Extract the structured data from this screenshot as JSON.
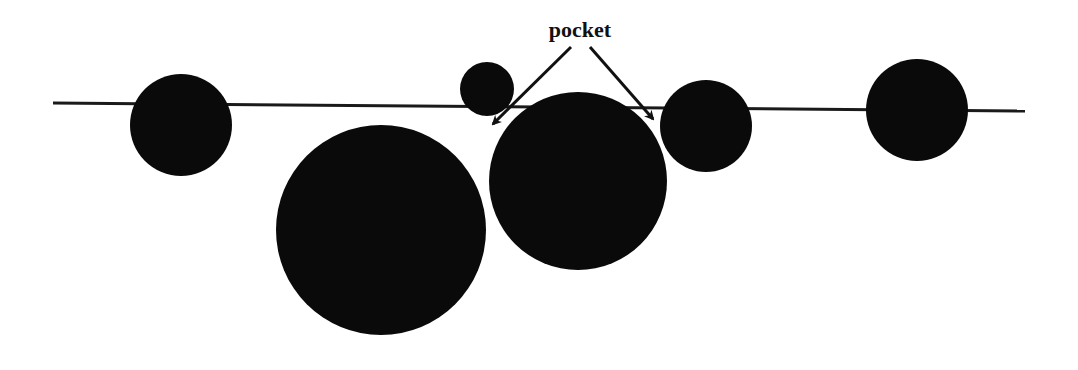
{
  "figure": {
    "width": 1078,
    "height": 370,
    "background": "#ffffff",
    "fill_color": "#0a0a0a",
    "line_color": "#1a1a1a"
  },
  "label": {
    "text": "pocket",
    "x": 580,
    "y": 37
  },
  "baseline": {
    "x1": 53,
    "y1": 103,
    "x2": 1025,
    "y2": 111
  },
  "circles": [
    {
      "id": "circle-1",
      "cx": 181,
      "cy": 125,
      "r": 51
    },
    {
      "id": "circle-2",
      "cx": 381,
      "cy": 230,
      "r": 105
    },
    {
      "id": "circle-3",
      "cx": 487,
      "cy": 89,
      "r": 27
    },
    {
      "id": "circle-4",
      "cx": 578,
      "cy": 181,
      "r": 89
    },
    {
      "id": "circle-5",
      "cx": 706,
      "cy": 126,
      "r": 46
    },
    {
      "id": "circle-6",
      "cx": 917,
      "cy": 110,
      "r": 51
    }
  ],
  "arrows": [
    {
      "id": "arrow-left",
      "x1": 571,
      "y1": 47,
      "x2": 493,
      "y2": 124
    },
    {
      "id": "arrow-right",
      "x1": 590,
      "y1": 47,
      "x2": 653,
      "y2": 119
    }
  ]
}
